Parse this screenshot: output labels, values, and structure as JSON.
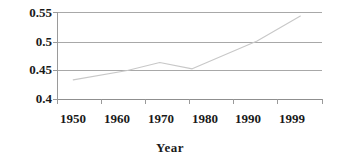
{
  "chart_data": {
    "type": "line",
    "title": "",
    "xlabel": "Year",
    "ylabel": "",
    "grid": true,
    "legend": "none",
    "xlim": [
      1950,
      1999
    ],
    "ylim": [
      0.4,
      0.55
    ],
    "x_tick_labels": [
      "1950",
      "1960",
      "1970",
      "1980",
      "1990",
      "1999"
    ],
    "x_tick_values": [
      1950,
      1960,
      1970,
      1980,
      1990,
      1999
    ],
    "y_tick_labels": [
      "0.55",
      "0.5",
      "0.45",
      "0.4"
    ],
    "y_tick_values": [
      0.55,
      0.5,
      0.45,
      0.4
    ],
    "series": [
      {
        "name": "",
        "color": "#c8c8c8",
        "x": [
          1953,
          1963,
          1969,
          1975,
          1987,
          1995
        ],
        "values": [
          0.433,
          0.449,
          0.463,
          0.452,
          0.5,
          0.543
        ]
      }
    ]
  },
  "axis": {
    "x_title": "Year",
    "y_labels": [
      {
        "text": "0.55",
        "top": 6
      },
      {
        "text": "0.5",
        "top": 35
      },
      {
        "text": "0.45",
        "top": 63
      },
      {
        "text": "0.4",
        "top": 92
      }
    ],
    "x_labels": [
      {
        "text": "1950",
        "left": 73
      },
      {
        "text": "1960",
        "left": 117
      },
      {
        "text": "1970",
        "left": 161
      },
      {
        "text": "1980",
        "left": 205
      },
      {
        "text": "1990",
        "left": 248
      },
      {
        "text": "1999",
        "left": 292
      }
    ]
  },
  "colors": {
    "grid": "#a8a8a8",
    "axis": "#9a9a9a",
    "series": "#c8c8c8",
    "text": "#1a1a1a",
    "background": "#ffffff"
  }
}
